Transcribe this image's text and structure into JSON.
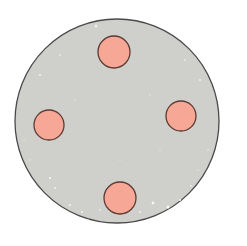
{
  "diagram": {
    "background": "#ffffff",
    "plate": {
      "cx": 117,
      "cy": 121,
      "r": 102,
      "fill": "#cfd0cb",
      "stroke": "#4a4a4a",
      "stroke_width": 1.3
    },
    "speckle_color": "#f7f7f4",
    "dots": [
      {
        "id": "top",
        "cx": 114,
        "cy": 52,
        "r": 16,
        "fill": "#f6a796",
        "stroke": "#5b3a33"
      },
      {
        "id": "left",
        "cx": 49,
        "cy": 125,
        "r": 15,
        "fill": "#f6a796",
        "stroke": "#5b3a33"
      },
      {
        "id": "right",
        "cx": 181,
        "cy": 116,
        "r": 15,
        "fill": "#f6a796",
        "stroke": "#5b3a33"
      },
      {
        "id": "bottom",
        "cx": 120,
        "cy": 198,
        "r": 16,
        "fill": "#f6a796",
        "stroke": "#5b3a33"
      }
    ],
    "speckles": [
      [
        96,
        26,
        1.2
      ],
      [
        40,
        75,
        1.0
      ],
      [
        60,
        55,
        0.8
      ],
      [
        200,
        80,
        0.9
      ],
      [
        185,
        60,
        0.8
      ],
      [
        50,
        178,
        1.1
      ],
      [
        55,
        188,
        0.9
      ],
      [
        70,
        205,
        1.0
      ],
      [
        82,
        212,
        0.9
      ],
      [
        100,
        210,
        0.8
      ],
      [
        140,
        212,
        0.9
      ],
      [
        153,
        203,
        1.4
      ],
      [
        168,
        207,
        1.6
      ],
      [
        180,
        200,
        0.9
      ],
      [
        191,
        186,
        0.8
      ],
      [
        40,
        200,
        0.7
      ],
      [
        30,
        160,
        0.7
      ],
      [
        208,
        150,
        0.7
      ],
      [
        150,
        95,
        0.6
      ],
      [
        75,
        100,
        0.6
      ],
      [
        120,
        160,
        0.6
      ],
      [
        160,
        150,
        0.6
      ],
      [
        130,
        230,
        0.6
      ],
      [
        105,
        226,
        0.8
      ],
      [
        150,
        223,
        0.7
      ],
      [
        88,
        220,
        0.8
      ],
      [
        198,
        170,
        0.6
      ],
      [
        24,
        140,
        0.6
      ]
    ]
  }
}
